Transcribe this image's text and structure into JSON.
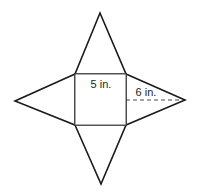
{
  "diagram": {
    "type": "net of square pyramid",
    "base": {
      "shape": "square",
      "side_label": "5 in."
    },
    "faces": [
      {
        "position": "top",
        "shape": "triangle"
      },
      {
        "position": "right",
        "shape": "triangle",
        "height_label": "6 in."
      },
      {
        "position": "bottom",
        "shape": "triangle"
      },
      {
        "position": "left",
        "shape": "triangle"
      }
    ],
    "colors": {
      "outline": "#1a1a1a",
      "square": "#555555",
      "dash": "#333333"
    }
  }
}
